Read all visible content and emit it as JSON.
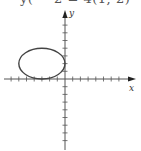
{
  "caption": "y( − 2 = 4(1, 2)",
  "graph": {
    "x_label": "x",
    "y_label": "y",
    "x_range": [
      -7,
      7
    ],
    "y_range": [
      -8,
      8
    ],
    "tick_step": 1,
    "curve": {
      "type": "ellipse",
      "center": [
        -3,
        2
      ],
      "semi_axis_x": 3,
      "semi_axis_y": 2,
      "equation": "(x+3)^2/9 + (y-2)^2/4 = 1"
    },
    "colors": {
      "axis": "#555555",
      "curve": "#444444"
    }
  }
}
